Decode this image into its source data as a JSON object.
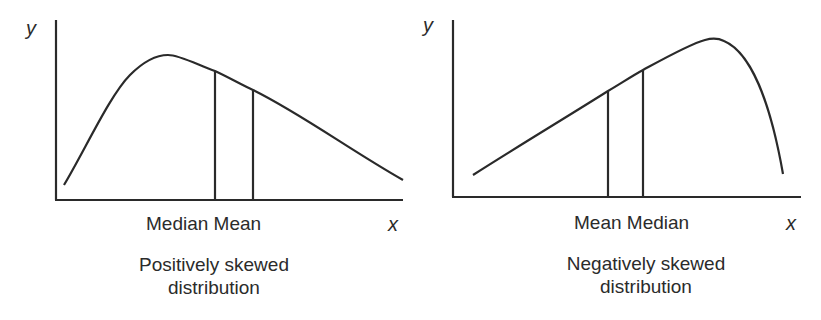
{
  "panels": [
    {
      "id": "positive",
      "y_axis_label": "y",
      "x_axis_label": "x",
      "marker_labels": "Median Mean",
      "caption_line1": "Positively skewed",
      "caption_line2": "distribution",
      "markers": [
        {
          "name": "Median",
          "order": 1
        },
        {
          "name": "Mean",
          "order": 2
        }
      ],
      "skew": "right (positive)"
    },
    {
      "id": "negative",
      "y_axis_label": "y",
      "x_axis_label": "x",
      "marker_labels": "Mean Median",
      "caption_line1": "Negatively skewed",
      "caption_line2": "distribution",
      "markers": [
        {
          "name": "Mean",
          "order": 1
        },
        {
          "name": "Median",
          "order": 2
        }
      ],
      "skew": "left (negative)"
    }
  ],
  "colors": {
    "stroke": "#2a2a2a",
    "background": "#ffffff"
  }
}
